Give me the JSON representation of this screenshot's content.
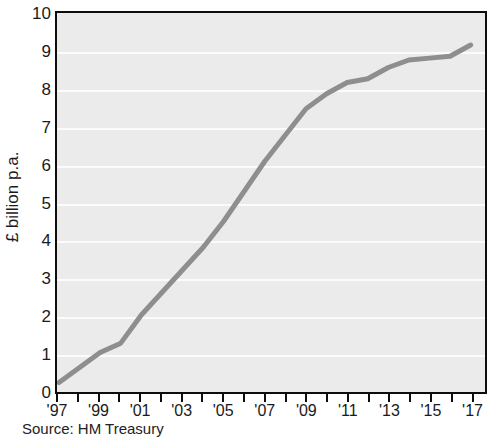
{
  "chart_data": {
    "type": "line",
    "title": "",
    "xlabel": "",
    "ylabel": "£ billion p.a.",
    "ylim": [
      0,
      10
    ],
    "xlim": [
      1997,
      2017.6
    ],
    "grid": true,
    "legend": null,
    "y_ticks": [
      "0",
      "1",
      "2",
      "3",
      "4",
      "5",
      "6",
      "7",
      "8",
      "9",
      "10"
    ],
    "y_tick_values": [
      0,
      1,
      2,
      3,
      4,
      5,
      6,
      7,
      8,
      9,
      10
    ],
    "x_tick_labels": [
      "'97",
      "'99",
      "'01",
      "'03",
      "'05",
      "'07",
      "'09",
      "'11",
      "'13",
      "'15",
      "'17"
    ],
    "x_tick_values": [
      1997,
      1999,
      2001,
      2003,
      2005,
      2007,
      2009,
      2011,
      2013,
      2015,
      2017
    ],
    "x_minor_ticks": [
      1997,
      1998,
      1999,
      2000,
      2001,
      2002,
      2003,
      2004,
      2005,
      2006,
      2007,
      2008,
      2009,
      2010,
      2011,
      2012,
      2013,
      2014,
      2015,
      2016,
      2017
    ],
    "series": [
      {
        "name": "series-1",
        "color": "#8e8e8e",
        "x": [
          1997,
          1998,
          1999,
          2000,
          2001,
          2002,
          2003,
          2004,
          2005,
          2006,
          2007,
          2008,
          2009,
          2010,
          2011,
          2012,
          2013,
          2014,
          2015,
          2016,
          2017
        ],
        "values": [
          0.2,
          0.6,
          1.0,
          1.25,
          2.0,
          2.6,
          3.2,
          3.8,
          4.5,
          5.3,
          6.1,
          6.8,
          7.5,
          7.9,
          8.2,
          8.3,
          8.6,
          8.8,
          8.85,
          8.9,
          9.2
        ]
      }
    ],
    "annotations": []
  },
  "source": {
    "text": "Source: HM Treasury"
  },
  "style": {
    "plot_background": "#ebebeb",
    "gridline_color": "#fbfbfb",
    "frame_color": "#0d0d0d",
    "line_color": "#8e8e8e",
    "text_color": "#1a1a1a"
  }
}
